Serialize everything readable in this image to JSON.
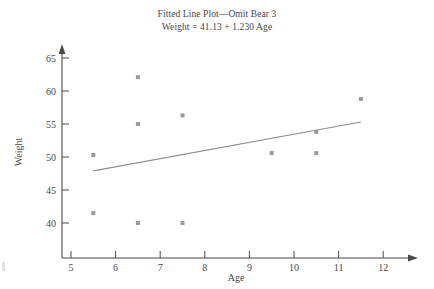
{
  "figure": {
    "title_line1": "Fitted Line Plot—Omit Bear 3",
    "title_line2": "Weight = 41.13 + 1.230 Age",
    "axis_color": "#4a4a4a",
    "point_color": "#9a9a9a",
    "line_color": "#8e8e8e",
    "background": "#ffffff"
  },
  "axes": {
    "x_title": "Age",
    "y_title": "Weight",
    "x_ticks": [
      "5",
      "6",
      "7",
      "8",
      "9",
      "10",
      "11",
      "12"
    ],
    "y_ticks": [
      "40",
      "45",
      "50",
      "55",
      "60",
      "65"
    ]
  },
  "chart_data": {
    "type": "scatter",
    "title": "Fitted Line Plot—Omit Bear 3",
    "subtitle": "Weight = 41.13 + 1.230 Age",
    "xlabel": "Age",
    "ylabel": "Weight",
    "xlim": [
      4.6,
      12.4
    ],
    "ylim": [
      37.5,
      65.8
    ],
    "xticks": [
      5,
      6,
      7,
      8,
      9,
      10,
      11,
      12
    ],
    "yticks": [
      40,
      45,
      50,
      55,
      60,
      65
    ],
    "grid": false,
    "legend": false,
    "points": [
      {
        "x": 5.5,
        "y": 50.3
      },
      {
        "x": 5.5,
        "y": 41.5
      },
      {
        "x": 6.5,
        "y": 62.1
      },
      {
        "x": 6.5,
        "y": 55.0
      },
      {
        "x": 6.5,
        "y": 40.0
      },
      {
        "x": 7.5,
        "y": 56.3
      },
      {
        "x": 7.5,
        "y": 40.0
      },
      {
        "x": 9.5,
        "y": 50.6
      },
      {
        "x": 10.5,
        "y": 53.8
      },
      {
        "x": 10.5,
        "y": 50.6
      },
      {
        "x": 11.5,
        "y": 58.8
      }
    ],
    "fit_line": {
      "equation": "Weight = 41.13 + 1.230 Age",
      "intercept": 41.13,
      "slope": 1.23,
      "x_start": 5.5,
      "x_end": 11.5,
      "y_start": 47.9,
      "y_end": 55.3
    }
  }
}
